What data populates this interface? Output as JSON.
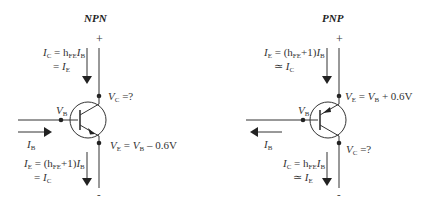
{
  "npn": {
    "title": "NPN",
    "plus": "+",
    "minus": "-",
    "ic_line1_var": "I",
    "ic_line1_sub": "C",
    "ic_line1_eq": " = h",
    "ic_line1_hsub": "FE",
    "ic_line1_i": "I",
    "ic_line1_isub": "B",
    "ic_line2_eq": "= ",
    "ic_line2_var": "I",
    "ic_line2_sub": "E",
    "vc_var": "V",
    "vc_sub": "C",
    "vc_eq": " =?",
    "vb_var": "V",
    "vb_sub": "B",
    "ib_var": "I",
    "ib_sub": "B",
    "ve_var": "V",
    "ve_sub": "E",
    "ve_eq": " = ",
    "ve_var2": "V",
    "ve_sub2": "B",
    "ve_tail": " – 0.6V",
    "ie_line1_var": "I",
    "ie_line1_sub": "E",
    "ie_line1_eq": " = (h",
    "ie_line1_hsub": "FE",
    "ie_line1_mid": "+1)",
    "ie_line1_i": "I",
    "ie_line1_isub": "B",
    "ie_line2_eq": "= ",
    "ie_line2_var": "I",
    "ie_line2_sub": "C"
  },
  "pnp": {
    "title": "PNP",
    "plus": "+",
    "minus": "-",
    "ie_line1_var": "I",
    "ie_line1_sub": "E",
    "ie_line1_eq": " = (h",
    "ie_line1_hsub": "FE",
    "ie_line1_mid": "+1)",
    "ie_line1_i": "I",
    "ie_line1_isub": "B",
    "ie_line2_eq": "≃ ",
    "ie_line2_var": "I",
    "ie_line2_sub": "C",
    "ve_var": "V",
    "ve_sub": "E",
    "ve_eq": " = ",
    "ve_var2": "V",
    "ve_sub2": "B",
    "ve_tail": " + 0.6V",
    "vb_var": "V",
    "vb_sub": "B",
    "ib_var": "I",
    "ib_sub": "B",
    "vc_var": "V",
    "vc_sub": "C",
    "vc_eq": " =?",
    "ic_line1_var": "I",
    "ic_line1_sub": "C",
    "ic_line1_eq": " = h",
    "ic_line1_hsub": "FE",
    "ic_line1_i": "I",
    "ic_line1_isub": "B",
    "ic_line2_eq": "≃ ",
    "ic_line2_var": "I",
    "ic_line2_sub": "E"
  }
}
